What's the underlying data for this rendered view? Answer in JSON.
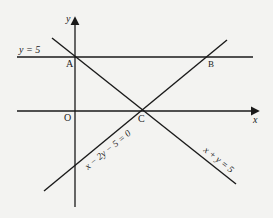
{
  "diagram": {
    "type": "coordinate-geometry",
    "axes": {
      "x_label": "x",
      "y_label": "y",
      "origin_label": "O"
    },
    "points": [
      {
        "label": "A",
        "description": "intersection of y = 5 and x + y = 5 on the y-axis"
      },
      {
        "label": "B",
        "description": "intersection of y = 5 and x - 2y - 5 = 0"
      },
      {
        "label": "C",
        "description": "intersection of x + y = 5 and x - 2y - 5 = 0 on the x-axis"
      }
    ],
    "lines": [
      {
        "equation": "y = 5",
        "orientation": "horizontal"
      },
      {
        "equation": "x + y = 5",
        "orientation": "descending"
      },
      {
        "equation": "x − 2y − 5 = 0",
        "orientation": "ascending"
      }
    ],
    "labels": {
      "y_axis": "y",
      "x_axis": "x",
      "origin": "O",
      "point_a": "A",
      "point_b": "B",
      "point_c": "C",
      "line_horizontal": "y = 5",
      "line_desc": "x + y = 5",
      "line_asc": "x − 2y − 5 = 0"
    },
    "colors": {
      "ink": "#1a1a1a",
      "paper": "#f3f3f1"
    }
  }
}
